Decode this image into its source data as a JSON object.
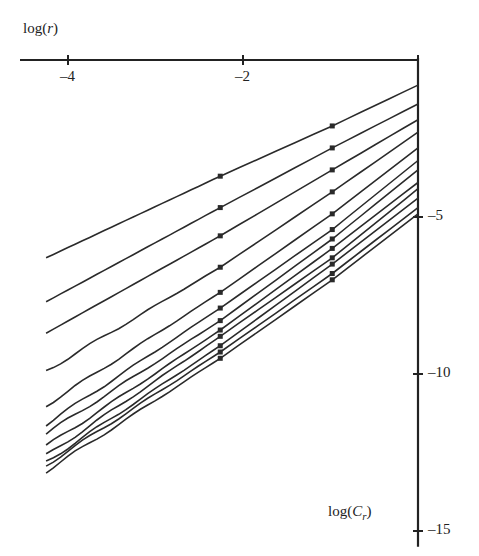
{
  "chart_data": {
    "type": "line",
    "title": "",
    "xlabel": "log(r)",
    "ylabel": "log(C_r)",
    "xlabel_display": {
      "pre": "log(",
      "ital": "r",
      "post": ")"
    },
    "ylabel_display": {
      "pre": "log(",
      "ital": "C",
      "sub": "r",
      "post": ")"
    },
    "xlim": [
      -4.4,
      0
    ],
    "ylim": [
      -15.5,
      0
    ],
    "x_ticks": [
      -4,
      -2,
      0
    ],
    "x_tick_labels": [
      "-4",
      "-2",
      ""
    ],
    "y_ticks": [
      -5,
      -10,
      -15
    ],
    "y_tick_labels": [
      "-5",
      "-10",
      "-15"
    ],
    "x_axis_position": "top",
    "y_axis_position": "right",
    "grid": false,
    "legend": null,
    "marker_x": [
      -2.26,
      -0.98
    ],
    "series": [
      {
        "name": "m1",
        "x": [
          -4.25,
          -2.26,
          -0.98,
          0
        ],
        "y": [
          -6.3,
          -3.7,
          -2.1,
          -0.8
        ]
      },
      {
        "name": "m2",
        "x": [
          -4.25,
          -2.26,
          -0.98,
          0
        ],
        "y": [
          -7.7,
          -4.7,
          -2.8,
          -1.4
        ]
      },
      {
        "name": "m3",
        "x": [
          -4.25,
          -2.26,
          -0.98,
          0
        ],
        "y": [
          -8.7,
          -5.6,
          -3.5,
          -1.9
        ]
      },
      {
        "name": "m4",
        "x": [
          -4.25,
          -2.26,
          -0.98,
          0
        ],
        "y": [
          -9.9,
          -6.6,
          -4.2,
          -2.3
        ]
      },
      {
        "name": "m5",
        "x": [
          -4.25,
          -2.26,
          -0.98,
          0
        ],
        "y": [
          -11.0,
          -7.4,
          -4.9,
          -2.8
        ]
      },
      {
        "name": "m6",
        "x": [
          -4.25,
          -2.26,
          -0.98,
          0
        ],
        "y": [
          -11.6,
          -7.9,
          -5.4,
          -3.2
        ]
      },
      {
        "name": "m7",
        "x": [
          -4.25,
          -2.26,
          -0.98,
          0
        ],
        "y": [
          -11.9,
          -8.3,
          -5.7,
          -3.5
        ]
      },
      {
        "name": "m8",
        "x": [
          -4.25,
          -2.26,
          -0.98,
          0
        ],
        "y": [
          -12.3,
          -8.6,
          -6.0,
          -3.9
        ]
      },
      {
        "name": "m9",
        "x": [
          -4.25,
          -2.26,
          -0.98,
          0
        ],
        "y": [
          -12.6,
          -8.8,
          -6.3,
          -4.1
        ]
      },
      {
        "name": "m10",
        "x": [
          -4.25,
          -2.26,
          -0.98,
          0
        ],
        "y": [
          -12.8,
          -9.1,
          -6.5,
          -4.4
        ]
      },
      {
        "name": "m11",
        "x": [
          -4.25,
          -2.26,
          -0.98,
          0
        ],
        "y": [
          -12.9,
          -9.3,
          -6.8,
          -4.7
        ]
      },
      {
        "name": "m12",
        "x": [
          -4.25,
          -2.26,
          -0.98,
          0
        ],
        "y": [
          -13.1,
          -9.5,
          -7.0,
          -4.9
        ]
      }
    ],
    "style": {
      "line_color": "#2a2a2a",
      "axis_color": "#222222",
      "background": "#ffffff"
    }
  },
  "layout": {
    "origin_px": [
      418,
      60
    ],
    "px_per_x_unit": 87.5,
    "px_per_y_unit": 31.4,
    "x_axis_left_px": 20
  }
}
